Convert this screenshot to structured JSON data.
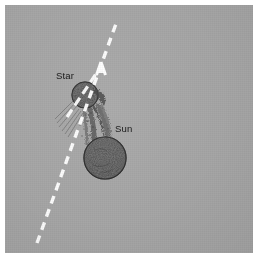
{
  "figure": {
    "kind": "astronomy-illustration",
    "background_color": "#a6a6a6",
    "page_color": "#ffffff",
    "ink_color": "#1a1a1a",
    "trajectory_color": "#ffffff"
  },
  "labels": {
    "star": "Star",
    "sun": "Sun"
  },
  "bodies": [
    {
      "name": "star",
      "label": "Star",
      "center_x": 80,
      "center_y": 90,
      "radius": 13,
      "fill": "#4a4a4a"
    },
    {
      "name": "sun",
      "label": "Sun",
      "center_x": 100,
      "center_y": 153,
      "radius": 21,
      "fill": "#4f4f4f"
    }
  ],
  "trajectory": {
    "name": "star-trajectory",
    "style": "dashed",
    "color": "#ffffff",
    "arrow_head": "open-arrow",
    "start_x": 32,
    "start_y": 238,
    "end_x": 112,
    "end_y": 16,
    "arrow_tip_x": 96,
    "arrow_tip_y": 57
  },
  "tidal_stream": {
    "name": "tidal-filament",
    "description": "Stream of drawn-out material connecting the star and the Sun",
    "color": "#3d3d3d"
  }
}
